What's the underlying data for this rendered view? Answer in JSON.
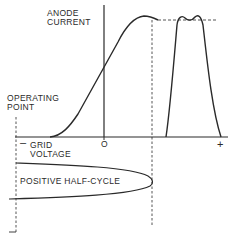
{
  "labels": {
    "y_axis_line1": "ANODE",
    "y_axis_line2": "CURRENT",
    "operating_line1": "OPERATING",
    "operating_line2": "POINT",
    "x_axis_line1": "GRID",
    "x_axis_line2": "VOLTAGE",
    "minus_sign": "–",
    "zero": "O",
    "plus_sign": "+",
    "half_cycle": "POSITIVE HALF-CYCLE"
  },
  "colors": {
    "ink": "#2a2a2a",
    "background": "#ffffff"
  }
}
